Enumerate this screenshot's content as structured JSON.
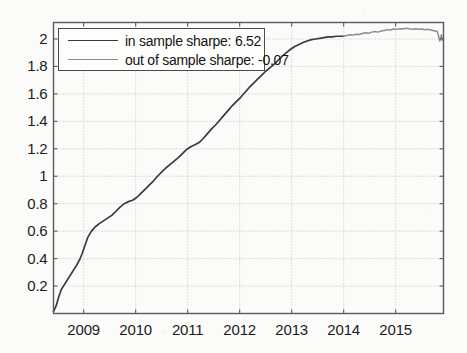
{
  "chart_data": {
    "type": "line",
    "title": "",
    "xlabel": "",
    "ylabel": "",
    "xlim": [
      2008.42,
      2015.92
    ],
    "ylim": [
      0.0,
      2.12
    ],
    "grid": true,
    "legend_position": "upper left",
    "xticks": [
      2009,
      2010,
      2011,
      2012,
      2013,
      2014,
      2015
    ],
    "xtick_labels": [
      "2009",
      "2010",
      "2011",
      "2012",
      "2013",
      "2014",
      "2015"
    ],
    "yticks": [
      0.2,
      0.4,
      0.6,
      0.8,
      1,
      1.2,
      1.4,
      1.6,
      1.8,
      2
    ],
    "ytick_labels": [
      "0.2",
      "0.4",
      "0.6",
      "0.8",
      "1",
      "1.2",
      "1.4",
      "1.6",
      "1.8",
      "2"
    ],
    "series": [
      {
        "name": "in sample sharpe: 6.52",
        "color": "#3b3b3b",
        "x": [
          2008.42,
          2008.47,
          2008.52,
          2008.57,
          2008.62,
          2008.67,
          2008.72,
          2008.77,
          2008.82,
          2008.87,
          2008.92,
          2008.97,
          2009.02,
          2009.08,
          2009.15,
          2009.22,
          2009.3,
          2009.38,
          2009.46,
          2009.54,
          2009.62,
          2009.7,
          2009.78,
          2009.86,
          2009.94,
          2010.02,
          2010.1,
          2010.18,
          2010.26,
          2010.34,
          2010.42,
          2010.5,
          2010.58,
          2010.66,
          2010.74,
          2010.82,
          2010.9,
          2010.98,
          2011.06,
          2011.14,
          2011.22,
          2011.3,
          2011.38,
          2011.46,
          2011.54,
          2011.62,
          2011.7,
          2011.78,
          2011.86,
          2011.94,
          2012.02,
          2012.1,
          2012.18,
          2012.26,
          2012.34,
          2012.42,
          2012.5,
          2012.58,
          2012.66,
          2012.74,
          2012.82,
          2012.9,
          2012.98,
          2013.06,
          2013.14,
          2013.22,
          2013.3,
          2013.38,
          2013.46,
          2013.54,
          2013.62,
          2013.7,
          2013.78,
          2013.86,
          2013.94,
          2014.0
        ],
        "y": [
          0.015,
          0.055,
          0.12,
          0.175,
          0.205,
          0.235,
          0.265,
          0.295,
          0.325,
          0.355,
          0.39,
          0.435,
          0.49,
          0.555,
          0.6,
          0.63,
          0.655,
          0.675,
          0.695,
          0.715,
          0.745,
          0.775,
          0.8,
          0.815,
          0.825,
          0.845,
          0.875,
          0.905,
          0.935,
          0.965,
          1.0,
          1.03,
          1.06,
          1.085,
          1.11,
          1.135,
          1.165,
          1.195,
          1.215,
          1.23,
          1.245,
          1.275,
          1.31,
          1.345,
          1.375,
          1.41,
          1.445,
          1.48,
          1.515,
          1.545,
          1.575,
          1.61,
          1.645,
          1.675,
          1.705,
          1.735,
          1.765,
          1.79,
          1.815,
          1.845,
          1.875,
          1.9,
          1.925,
          1.945,
          1.96,
          1.975,
          1.985,
          1.995,
          2.0,
          2.005,
          2.01,
          2.015,
          2.015,
          2.02,
          2.02,
          2.02
        ]
      },
      {
        "name": "out of sample sharpe: -0.07",
        "color": "#8d8d8d",
        "x": [
          2014.0,
          2014.06,
          2014.12,
          2014.18,
          2014.24,
          2014.3,
          2014.36,
          2014.42,
          2014.48,
          2014.54,
          2014.6,
          2014.66,
          2014.72,
          2014.78,
          2014.84,
          2014.9,
          2014.96,
          2015.02,
          2015.08,
          2015.14,
          2015.2,
          2015.26,
          2015.32,
          2015.38,
          2015.44,
          2015.5,
          2015.56,
          2015.62,
          2015.68,
          2015.74,
          2015.8,
          2015.85,
          2015.88,
          2015.9,
          2015.92
        ],
        "y": [
          2.02,
          2.025,
          2.03,
          2.028,
          2.035,
          2.032,
          2.04,
          2.045,
          2.042,
          2.05,
          2.055,
          2.05,
          2.058,
          2.062,
          2.068,
          2.065,
          2.072,
          2.07,
          2.075,
          2.072,
          2.078,
          2.075,
          2.07,
          2.074,
          2.07,
          2.072,
          2.068,
          2.07,
          2.065,
          2.06,
          2.055,
          1.985,
          2.03,
          1.99,
          2.005
        ]
      }
    ]
  },
  "legend": {
    "entries": [
      {
        "label": "in sample sharpe: 6.52",
        "color": "#3b3b3b"
      },
      {
        "label": "out of sample sharpe: -0.07",
        "color": "#8d8d8d"
      }
    ]
  },
  "axes": {
    "frame_color": "#5a5a5a",
    "grid_color": "#b9b9b9",
    "background": "#fbfbf9"
  }
}
